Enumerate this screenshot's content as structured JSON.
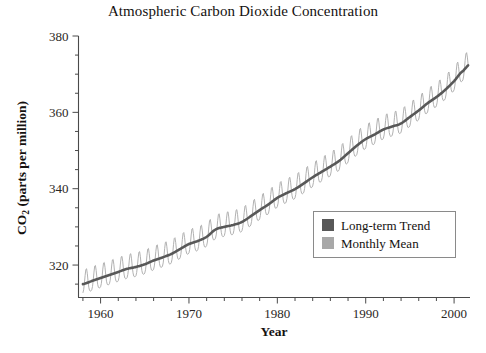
{
  "chart_data": {
    "type": "line",
    "title": "Atmospheric Carbon Dioxide Concentration",
    "xlabel": "Year",
    "ylabel": "CO2 (parts per million)",
    "ylabel_parts": {
      "prefix": "CO",
      "subscript": "2",
      "suffix": " (parts per million)"
    },
    "xlim": [
      1957.5,
      2001.8
    ],
    "ylim": [
      311.5,
      380
    ],
    "xticks": [
      1960,
      1970,
      1980,
      1990,
      2000
    ],
    "xtick_labels": [
      "1960",
      "1970",
      "1980",
      "1990",
      "2000"
    ],
    "x_minor_step": 2,
    "yticks": [
      320,
      340,
      360,
      380
    ],
    "ytick_labels": [
      "320",
      "340",
      "360",
      "380"
    ],
    "y_minor_step": 5,
    "grid": false,
    "legend_position": "lower right",
    "series": [
      {
        "name": "Long-term Trend",
        "color": "#585858",
        "style": "smooth-line",
        "x": [
          1958,
          1959,
          1960,
          1961,
          1962,
          1963,
          1964,
          1965,
          1966,
          1967,
          1968,
          1969,
          1970,
          1971,
          1972,
          1973,
          1974,
          1975,
          1976,
          1977,
          1978,
          1979,
          1980,
          1981,
          1982,
          1983,
          1984,
          1985,
          1986,
          1987,
          1988,
          1989,
          1990,
          1991,
          1992,
          1993,
          1994,
          1995,
          1996,
          1997,
          1998,
          1999,
          2000,
          2001
        ],
        "values": [
          315.0,
          315.8,
          316.6,
          317.4,
          318.2,
          319.0,
          319.5,
          320.2,
          321.2,
          322.0,
          322.9,
          324.2,
          325.5,
          326.3,
          327.4,
          329.3,
          330.0,
          330.5,
          331.3,
          332.8,
          334.4,
          335.9,
          337.6,
          338.8,
          339.9,
          341.4,
          343.0,
          344.4,
          345.8,
          347.3,
          349.3,
          351.3,
          353.0,
          354.2,
          355.5,
          356.3,
          357.1,
          358.8,
          360.5,
          362.4,
          364.0,
          365.9,
          368.2,
          370.8
        ]
      },
      {
        "name": "Monthly Mean",
        "color": "#a8a8a8",
        "style": "sawtooth-seasonal-cycle",
        "seasonal_amplitude_ppm": 3.2,
        "cycles_per_year": 1,
        "description": "Monthly mean values oscillating seasonally about the long-term trend"
      }
    ]
  },
  "legend": {
    "entries": [
      {
        "label": "Long-term Trend",
        "swatch_color": "#585858"
      },
      {
        "label": "Monthly Mean",
        "swatch_color": "#a8a8a8"
      }
    ],
    "border_color": "#8a8a8a"
  },
  "axis": {
    "spine_color": "#4a4a4a"
  }
}
